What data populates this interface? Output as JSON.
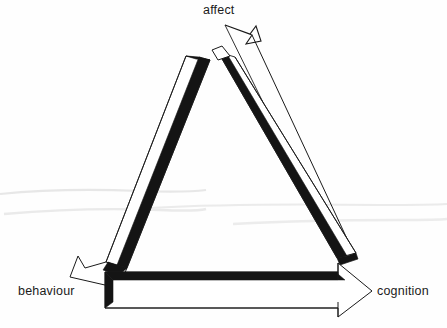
{
  "diagram": {
    "type": "cyclic-triangle-arrow-diagram",
    "background_color": "#fefefe",
    "ink_color": "#111111",
    "fill_color": "#ffffff",
    "artifact_color": "#d8d8d8",
    "nodes": [
      {
        "id": "affect",
        "label": "affect",
        "position": "top"
      },
      {
        "id": "behaviour",
        "label": "behaviour",
        "position": "bottom-left"
      },
      {
        "id": "cognition",
        "label": "cognition",
        "position": "bottom-right"
      }
    ],
    "arrows": [
      {
        "id": "arrow-affect-to-behaviour",
        "from": "affect",
        "to": "behaviour",
        "side": "left",
        "direction": "down-left"
      },
      {
        "id": "arrow-affect-to-cognition",
        "from": "affect",
        "to": "cognition",
        "side": "right",
        "direction": "down-right"
      },
      {
        "id": "arrow-behaviour-to-cognition",
        "from": "behaviour",
        "to": "cognition",
        "side": "bottom",
        "direction": "right"
      },
      {
        "id": "arrow-cognition-to-affect",
        "from": "cognition",
        "to": "affect",
        "side": "right-outer",
        "direction": "up-left"
      }
    ],
    "artifact_lines": [
      {
        "x1": 0,
        "y1": 193,
        "x2": 205,
        "y2": 191
      },
      {
        "x1": 0,
        "y1": 213,
        "x2": 200,
        "y2": 209
      },
      {
        "x1": 238,
        "y1": 206,
        "x2": 447,
        "y2": 204
      },
      {
        "x1": 232,
        "y1": 223,
        "x2": 447,
        "y2": 219
      }
    ]
  },
  "labels": {
    "affect": "affect",
    "behaviour": "behaviour",
    "cognition": "cognition"
  }
}
